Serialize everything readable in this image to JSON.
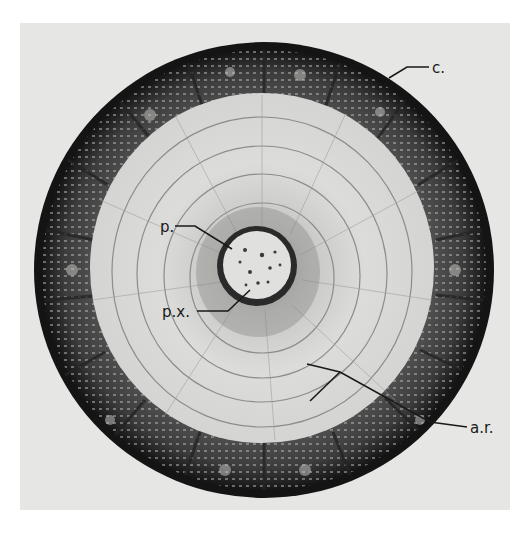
{
  "figure": {
    "background_color": "#e6e6e4",
    "labels": [
      {
        "id": "c",
        "text": "c.",
        "meaning": "cortex"
      },
      {
        "id": "p",
        "text": "p.",
        "meaning": "pith"
      },
      {
        "id": "px",
        "text": "p.x.",
        "meaning": "primary xylem"
      },
      {
        "id": "ar",
        "text": "a.r.",
        "meaning": "annual ring"
      }
    ],
    "colors": {
      "bark_dark": "#1c1c1c",
      "cortex_mid": "#4a4a4a",
      "xylem_light": "#d8d8d6",
      "ring_line": "#8a8a8a",
      "pith_fill": "#e2e2e0"
    }
  }
}
